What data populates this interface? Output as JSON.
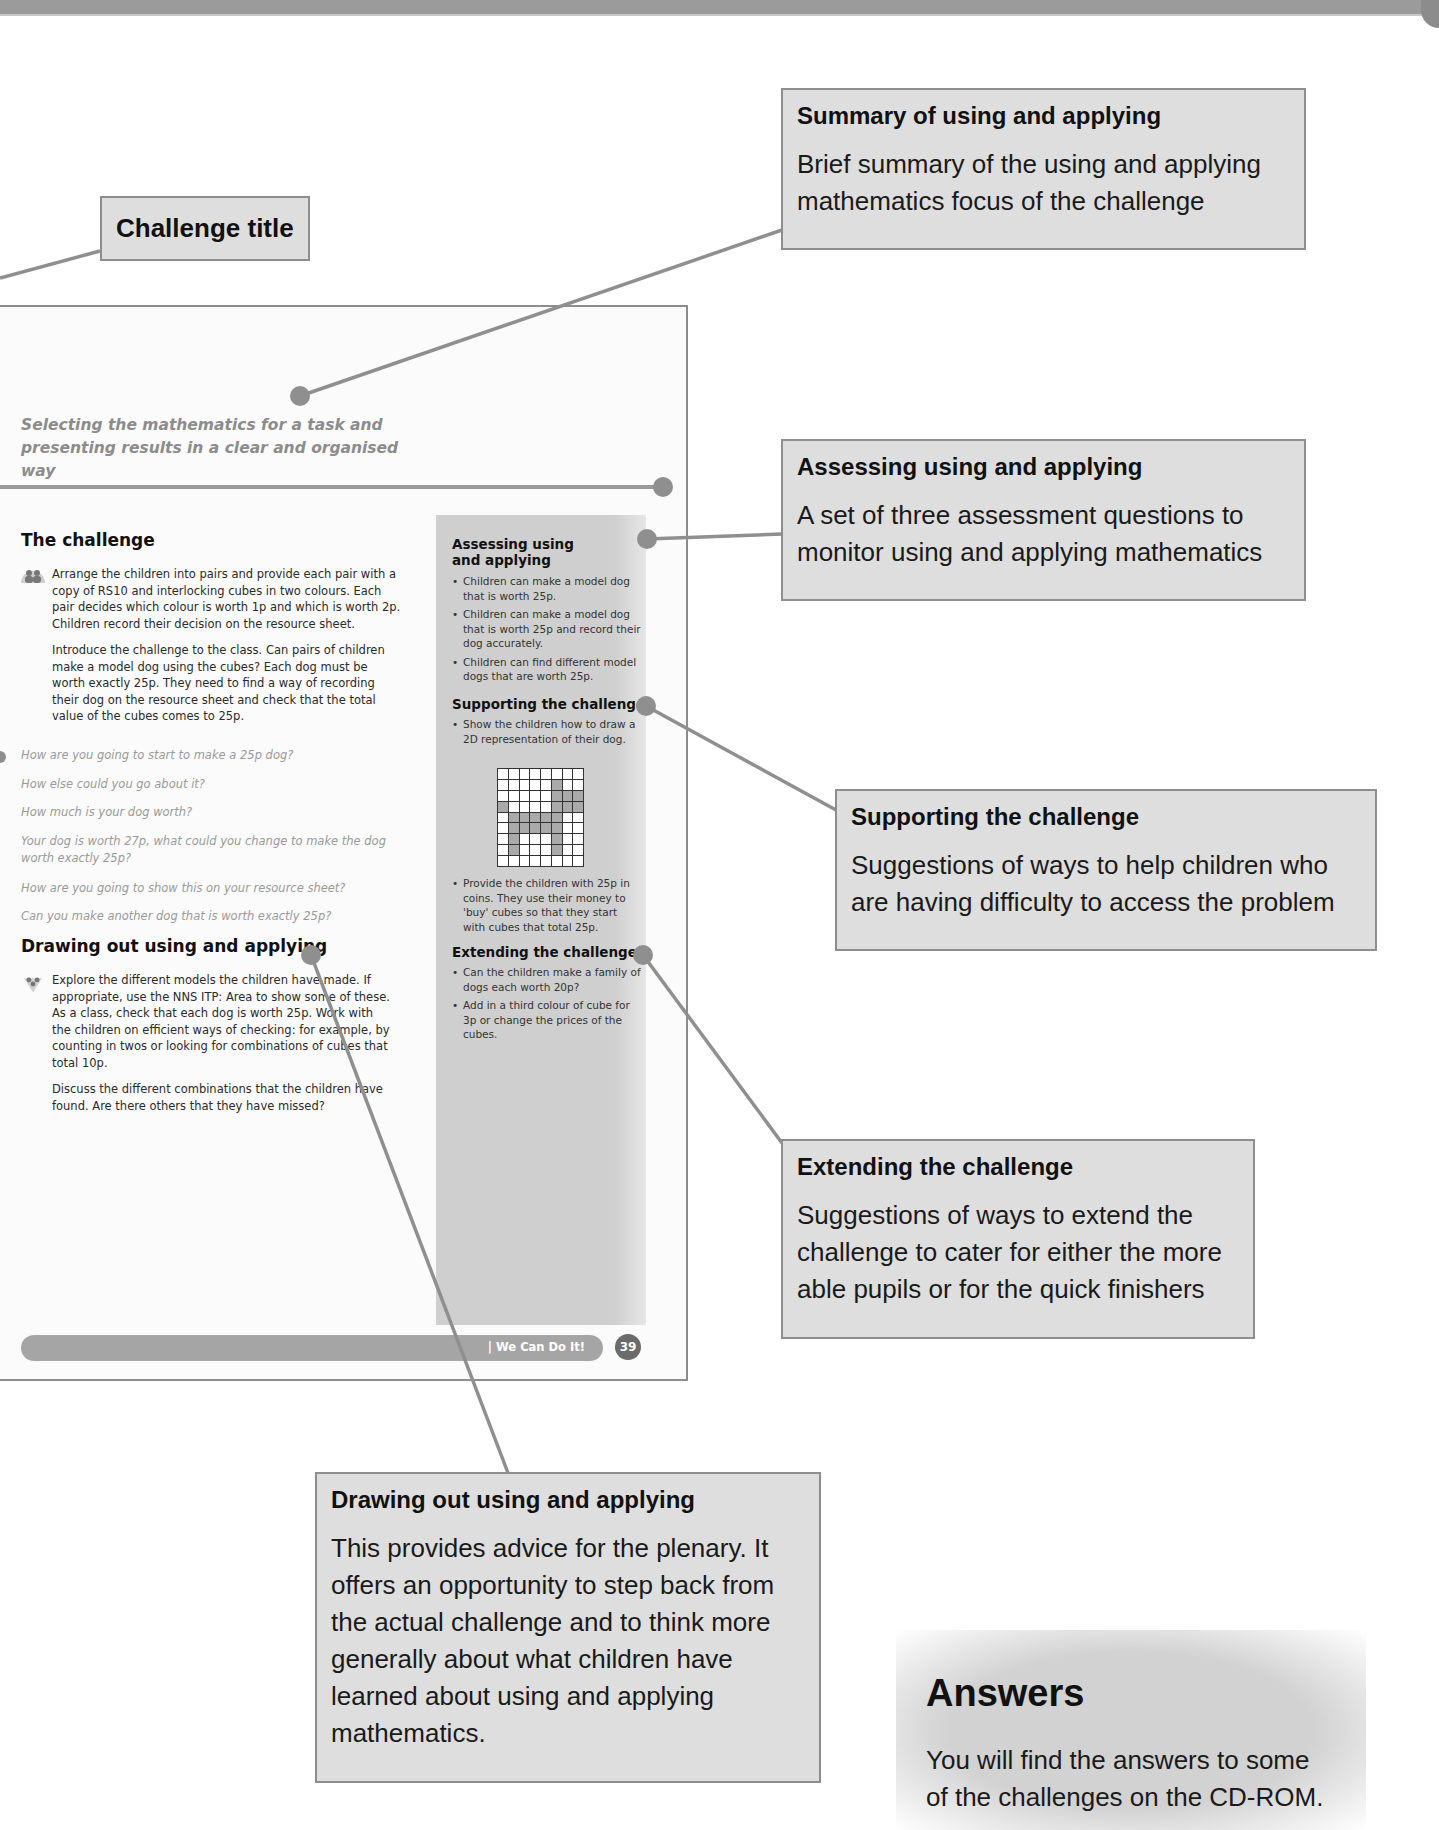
{
  "callouts": {
    "challenge_title": {
      "title": "Challenge title"
    },
    "summary": {
      "title": "Summary of using and applying",
      "body": "Brief summary of the using and applying mathematics focus of the challenge"
    },
    "assessing": {
      "title": "Assessing using and applying",
      "body": "A set of three assessment questions to monitor using and applying mathematics"
    },
    "supporting": {
      "title": "Supporting the challenge",
      "body": "Suggestions of ways to help children who are having difficulty to access the problem"
    },
    "extending": {
      "title": "Extending the challenge",
      "body": "Suggestions of ways to extend the challenge to cater for either the more able pupils or for the quick finishers"
    },
    "drawing_out": {
      "title": "Drawing out using and applying",
      "body": "This provides advice for the plenary. It offers an opportunity to step back from the actual challenge and to think more generally about what children have learned about using and applying mathematics."
    },
    "answers": {
      "title": "Answers",
      "body": "You will find the answers to some of the challenges on the CD-ROM."
    }
  },
  "page": {
    "summary": "Selecting the mathematics for a task and presenting results in a clear and organised way",
    "the_challenge": {
      "heading": "The challenge",
      "paragraphs": [
        "Arrange the children into pairs and provide each pair with a copy of RS10 and interlocking cubes in two colours. Each pair decides which colour is worth 1p and which is worth 2p. Children record their decision on the resource sheet.",
        "Introduce the challenge to the class. Can pairs of children make a model dog using the cubes? Each dog must be worth exactly 25p. They need to find a way of recording their dog on the resource sheet and check that the total value of the cubes comes to 25p."
      ],
      "questions": [
        "How are you going to start to make a 25p dog?",
        "How else could you go about it?",
        "How much is your dog worth?",
        "Your dog is worth 27p, what could you change to make the dog worth exactly 25p?",
        "How are you going to show this on your resource sheet?",
        "Can you make another dog that is worth exactly 25p?"
      ]
    },
    "drawing_out": {
      "heading": "Drawing out using and applying",
      "paragraphs": [
        "Explore the different models the children have made. If appropriate, use the NNS ITP: Area to show some of these. As a class, check that each dog is worth 25p. Work with the children on efficient ways of checking: for example, by counting in twos or looking for combinations of cubes that total 10p.",
        "Discuss the different combinations that the children have found. Are there others that they have missed?"
      ]
    },
    "sidebar": {
      "assessing": {
        "heading_line1": "Assessing using",
        "heading_line2": "and applying",
        "items": [
          "Children can make a model dog that is worth 25p.",
          "Children can make a model dog that is worth 25p and record their dog accurately.",
          "Children can find different model dogs that are worth 25p."
        ]
      },
      "supporting": {
        "heading": "Supporting the challenge",
        "items": [
          "Show the children how to draw a 2D representation of their dog.",
          "Provide the children with 25p in coins. They use their money to 'buy' cubes so that they start with cubes that total 25p."
        ]
      },
      "extending": {
        "heading": "Extending the challenge",
        "items": [
          "Can the children make a family of dogs each worth 20p?",
          "Add in a third colour of cube for 3p or change the prices of the cubes."
        ]
      }
    },
    "dog_grid": {
      "cols": 8,
      "rows": 9,
      "filled": [
        [
          1,
          5
        ],
        [
          2,
          5
        ],
        [
          2,
          6
        ],
        [
          2,
          7
        ],
        [
          3,
          0
        ],
        [
          3,
          5
        ],
        [
          3,
          6
        ],
        [
          3,
          7
        ],
        [
          4,
          1
        ],
        [
          4,
          2
        ],
        [
          4,
          3
        ],
        [
          4,
          4
        ],
        [
          4,
          5
        ],
        [
          5,
          1
        ],
        [
          5,
          2
        ],
        [
          5,
          3
        ],
        [
          5,
          4
        ],
        [
          5,
          5
        ],
        [
          6,
          1
        ],
        [
          6,
          5
        ],
        [
          7,
          1
        ],
        [
          7,
          5
        ]
      ]
    },
    "footer": {
      "label": "| We Can Do It!",
      "page_number": "39"
    }
  },
  "colors": {
    "callout_bg": "#dedede",
    "callout_border": "#8e8e8e",
    "connector": "#8f8f8f",
    "sidebar_bg": "#cfcfcf"
  }
}
